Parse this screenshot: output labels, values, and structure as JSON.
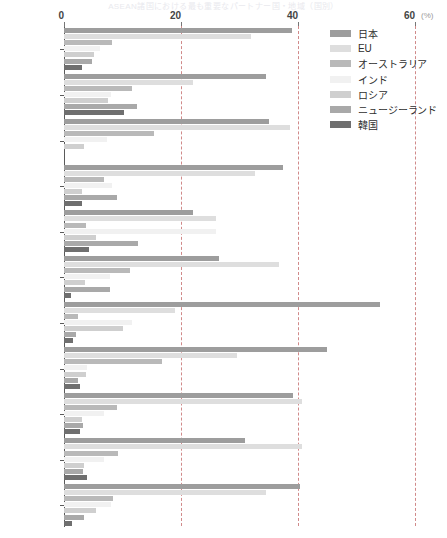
{
  "title_strip": "ASEAN諸国における最も重要なパートナー国・地域（国別）",
  "axis": {
    "unit_label": "(%)",
    "ticks": [
      0,
      20,
      40,
      60
    ],
    "xmin": 0,
    "xmax": 60
  },
  "legend": {
    "position": "top-right",
    "items": [
      {
        "label": "日本",
        "color": "#9d9d9d"
      },
      {
        "label": "EU",
        "color": "#dedede"
      },
      {
        "label": "オーストラリア",
        "color": "#b9b9b9"
      },
      {
        "label": "インド",
        "color": "#f1f1f1"
      },
      {
        "label": "ロシア",
        "color": "#cfcfcf"
      },
      {
        "label": "ニュージーランド",
        "color": "#a9a9a9"
      },
      {
        "label": "韓国",
        "color": "#6f6f6f"
      }
    ]
  },
  "chart_data": {
    "type": "bar",
    "orientation": "horizontal",
    "title": "ASEAN諸国における最も重要なパートナー国・地域（国別）",
    "xlabel": "(%)",
    "ylabel": "",
    "xlim": [
      0,
      60
    ],
    "grid": true,
    "categories": [
      "全体",
      "ブルネイ",
      "カンボジア",
      "インドネシア",
      "ラオス",
      "マレーシア",
      "ミャンマー",
      "フィリピン",
      "シンガポール",
      "タイ",
      "ベトナム"
    ],
    "series": [
      {
        "name": "日本",
        "color": "#9d9d9d",
        "values": [
          39.0,
          34.5,
          35.0,
          37.5,
          22.0,
          26.5,
          54.0,
          45.0,
          39.1,
          31.0,
          40.3
        ]
      },
      {
        "name": "EU",
        "color": "#dedede",
        "values": [
          32.0,
          22.0,
          38.7,
          32.6,
          26.0,
          36.8,
          19.0,
          29.5,
          40.7,
          40.7,
          34.5
        ]
      },
      {
        "name": "オーストラリア",
        "color": "#b9b9b9",
        "values": [
          8.2,
          11.7,
          15.4,
          6.8,
          3.8,
          11.3,
          2.4,
          16.7,
          9.0,
          9.2,
          8.4
        ]
      },
      {
        "name": "インド",
        "color": "#f1f1f1",
        "values": [
          6.2,
          8.0,
          7.3,
          8.2,
          26.0,
          7.8,
          11.7,
          4.0,
          6.8,
          6.8,
          8.0
        ]
      },
      {
        "name": "ロシア",
        "color": "#cfcfcf",
        "values": [
          5.1,
          7.5,
          3.4,
          3.0,
          5.5,
          3.6,
          10.0,
          3.8,
          3.0,
          3.4,
          5.5
        ]
      },
      {
        "name": "ニュージーランド",
        "color": "#a9a9a9",
        "values": [
          4.8,
          12.4,
          0.0,
          9.0,
          12.7,
          7.8,
          2.0,
          2.4,
          3.2,
          3.2,
          3.4
        ]
      },
      {
        "name": "韓国",
        "color": "#6f6f6f",
        "values": [
          3.1,
          10.3,
          0.0,
          3.0,
          4.3,
          1.2,
          1.6,
          2.7,
          2.7,
          4.0,
          1.4
        ]
      }
    ]
  }
}
